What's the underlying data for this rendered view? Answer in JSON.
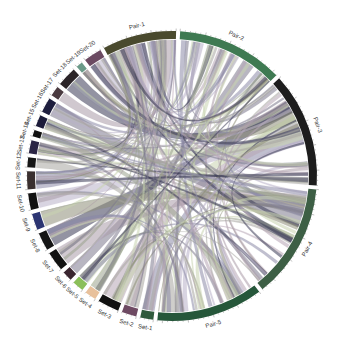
{
  "diagram": {
    "type": "chord",
    "center": [
      172,
      176
    ],
    "inner_radius": 137,
    "outer_radius": 145,
    "label_radius": 154,
    "gap_deg": 1.6,
    "start_deg": -28,
    "segments": [
      {
        "name": "Pair-1",
        "group": "pair",
        "size": 9,
        "color": "#4a4a2e"
      },
      {
        "name": "Pair-2",
        "group": "pair",
        "size": 13,
        "color": "#3f7a52"
      },
      {
        "name": "Pair-3",
        "group": "pair",
        "size": 14,
        "color": "#1d1d1d"
      },
      {
        "name": "Pair-4",
        "group": "pair",
        "size": 14,
        "color": "#3d5f45"
      },
      {
        "name": "Pair-5",
        "group": "pair",
        "size": 13,
        "color": "#26573a"
      },
      {
        "name": "Set-1",
        "group": "set",
        "size": 1.6,
        "color": "#2f5a3c"
      },
      {
        "name": "Set-2",
        "group": "set",
        "size": 1.8,
        "color": "#6e4a63"
      },
      {
        "name": "Set-3",
        "group": "set",
        "size": 2.6,
        "color": "#111111"
      },
      {
        "name": "Set-4",
        "group": "set",
        "size": 1.4,
        "color": "#e8c19c"
      },
      {
        "name": "Set-5",
        "group": "set",
        "size": 1.4,
        "color": "#8bbf5a"
      },
      {
        "name": "Set-6",
        "group": "set",
        "size": 1.2,
        "color": "#3a2630"
      },
      {
        "name": "Set-7",
        "group": "set",
        "size": 2.4,
        "color": "#121212"
      },
      {
        "name": "Set-8",
        "group": "set",
        "size": 2.2,
        "color": "#151515"
      },
      {
        "name": "Set-9",
        "group": "set",
        "size": 2.0,
        "color": "#2c3572"
      },
      {
        "name": "Set-10",
        "group": "set",
        "size": 2.0,
        "color": "#121212"
      },
      {
        "name": "Set-11",
        "group": "set",
        "size": 2.2,
        "color": "#3a3030"
      },
      {
        "name": "Set-12",
        "group": "set",
        "size": 1.2,
        "color": "#161616"
      },
      {
        "name": "Set-13",
        "group": "set",
        "size": 1.6,
        "color": "#2b2545"
      },
      {
        "name": "Set-14",
        "group": "set",
        "size": 0.8,
        "color": "#101010"
      },
      {
        "name": "Set-15",
        "group": "set",
        "size": 1.4,
        "color": "#1c1c3a"
      },
      {
        "name": "Set-16",
        "group": "set",
        "size": 1.8,
        "color": "#1e1e3e"
      },
      {
        "name": "Set-17",
        "group": "set",
        "size": 1.2,
        "color": "#4a3a40"
      },
      {
        "name": "Set-18",
        "group": "set",
        "size": 2.4,
        "color": "#2b2428"
      },
      {
        "name": "Set-19",
        "group": "set",
        "size": 0.8,
        "color": "#6a9a88"
      },
      {
        "name": "Set-20",
        "group": "set",
        "size": 2.2,
        "color": "#6b4a62"
      }
    ],
    "tick_labels": [
      "0",
      "5000",
      "10000"
    ],
    "ribbon_palette": [
      "#8c8aa8",
      "#a7a6a0",
      "#b6a5b4",
      "#9aa38e",
      "#c9d3b1",
      "#7d7a8e",
      "#a99aa8",
      "#3a3a55",
      "#8e8e78",
      "#b8b0c8"
    ],
    "ribbon_opacity": 0.55
  }
}
